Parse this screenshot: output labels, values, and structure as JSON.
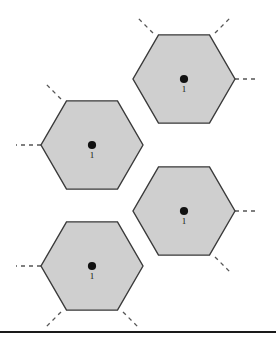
{
  "figure": {
    "type": "hexagonal-cell-diagram",
    "title": "",
    "background_color": "#ffffff",
    "cell_fill_color": "#cfcfcf",
    "cell_stroke_color": "#3a3a3a",
    "dash_stub_color": "#555555",
    "dot_color": "#111111",
    "label_color": "#111111",
    "cells": [
      {
        "id": "cell-top-right",
        "label": "1",
        "center_x": 184,
        "center_y": 79,
        "radius": 51,
        "dot_radius": 4.1
      },
      {
        "id": "cell-middle-left",
        "label": "1",
        "center_x": 92,
        "center_y": 145,
        "radius": 51,
        "dot_radius": 4.1
      },
      {
        "id": "cell-middle-right",
        "label": "1",
        "center_x": 184,
        "center_y": 211,
        "radius": 51,
        "dot_radius": 4.1
      },
      {
        "id": "cell-bottom-left",
        "label": "1",
        "center_x": 92,
        "center_y": 266,
        "radius": 51,
        "dot_radius": 4.1
      }
    ],
    "dash_stubs": [
      {
        "id": "stub-topleft-of-topright",
        "x1": 153,
        "y1": 33,
        "x2": 138,
        "y2": 18
      },
      {
        "id": "stub-topright-of-topright",
        "x1": 215,
        "y1": 33,
        "x2": 230,
        "y2": 18
      },
      {
        "id": "stub-right-of-topright",
        "x1": 235,
        "y1": 79,
        "x2": 258,
        "y2": 79
      },
      {
        "id": "stub-topleft-of-middleleft",
        "x1": 61,
        "y1": 99,
        "x2": 46,
        "y2": 84
      },
      {
        "id": "stub-left-of-middleleft",
        "x1": 41,
        "y1": 145,
        "x2": 16,
        "y2": 145
      },
      {
        "id": "stub-right-of-middleright",
        "x1": 235,
        "y1": 211,
        "x2": 258,
        "y2": 211
      },
      {
        "id": "stub-bottomright-of-middleright",
        "x1": 215,
        "y1": 257,
        "x2": 230,
        "y2": 272
      },
      {
        "id": "stub-left-of-bottomleft",
        "x1": 41,
        "y1": 266,
        "x2": 16,
        "y2": 266
      },
      {
        "id": "stub-bottomleft-of-bottomleft",
        "x1": 61,
        "y1": 312,
        "x2": 46,
        "y2": 327
      },
      {
        "id": "stub-bottomright-of-bottomleft",
        "x1": 123,
        "y1": 312,
        "x2": 138,
        "y2": 327
      }
    ],
    "bottom_rule": {
      "color": "#1a1a1a",
      "thickness_px": 2
    }
  }
}
